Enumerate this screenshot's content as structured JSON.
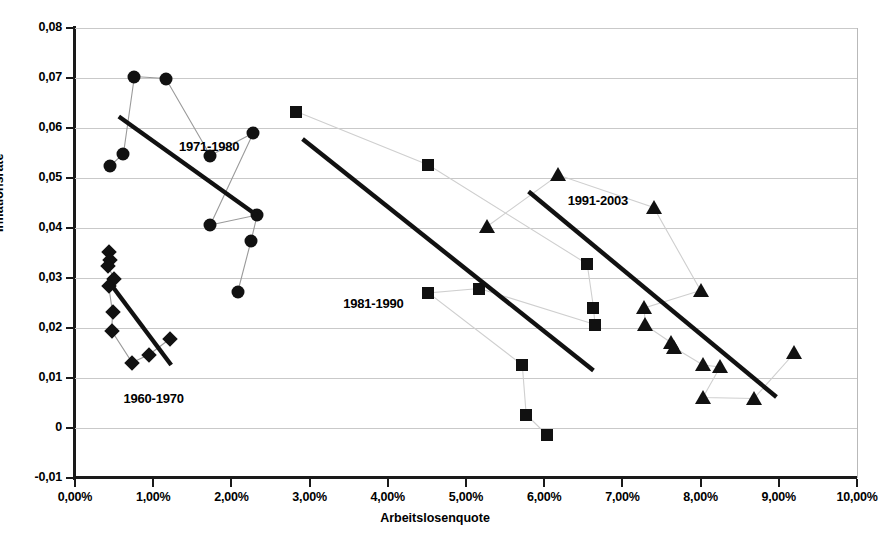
{
  "chart_data": {
    "type": "scatter",
    "title": "",
    "xlabel": "Arbeitslosenquote",
    "ylabel": "Inflationsrate",
    "xlim": [
      0,
      10
    ],
    "ylim": [
      -0.01,
      0.08
    ],
    "x_tick_labels": [
      "0,00%",
      "1,00%",
      "2,00%",
      "3,00%",
      "4,00%",
      "5,00%",
      "6,00%",
      "7,00%",
      "8,00%",
      "9,00%",
      "10,00%"
    ],
    "x_tick_values": [
      0,
      1,
      2,
      3,
      4,
      5,
      6,
      7,
      8,
      9,
      10
    ],
    "y_tick_labels": [
      "0,08",
      "0,07",
      "0,06",
      "0,05",
      "0,04",
      "0,03",
      "0,02",
      "0,01",
      "0",
      "-0,01"
    ],
    "y_tick_values": [
      0.08,
      0.07,
      0.06,
      0.05,
      0.04,
      0.03,
      0.02,
      0.01,
      0,
      -0.01
    ],
    "grid": true,
    "legend": "none",
    "x_unit": "%",
    "series": [
      {
        "name": "1960-1970",
        "marker": "diamond",
        "label": "1960-1970",
        "label_x": 0.62,
        "label_y": 0.0058,
        "connected": true,
        "points": [
          {
            "x": 0.44,
            "y": 0.0352
          },
          {
            "x": 0.45,
            "y": 0.0337
          },
          {
            "x": 0.42,
            "y": 0.0324
          },
          {
            "x": 0.5,
            "y": 0.0299
          },
          {
            "x": 0.43,
            "y": 0.0285
          },
          {
            "x": 0.48,
            "y": 0.0232
          },
          {
            "x": 0.47,
            "y": 0.0194
          },
          {
            "x": 0.73,
            "y": 0.0131
          },
          {
            "x": 0.95,
            "y": 0.0147
          },
          {
            "x": 1.22,
            "y": 0.0179
          }
        ]
      },
      {
        "name": "1971-1980",
        "marker": "circle",
        "label": "1971-1980",
        "label_x": 1.33,
        "label_y": 0.0563,
        "connected": true,
        "points": [
          {
            "x": 0.45,
            "y": 0.0524
          },
          {
            "x": 0.62,
            "y": 0.0549
          },
          {
            "x": 0.76,
            "y": 0.0703
          },
          {
            "x": 1.16,
            "y": 0.0699
          },
          {
            "x": 1.73,
            "y": 0.0545
          },
          {
            "x": 2.28,
            "y": 0.059
          },
          {
            "x": 1.73,
            "y": 0.0406
          },
          {
            "x": 2.33,
            "y": 0.0426
          },
          {
            "x": 2.25,
            "y": 0.0374
          },
          {
            "x": 2.08,
            "y": 0.0272
          }
        ]
      },
      {
        "name": "1981-1990",
        "marker": "square",
        "label": "1981-1990",
        "label_x": 3.43,
        "label_y": 0.0248,
        "connected": true,
        "points": [
          {
            "x": 2.83,
            "y": 0.0633
          },
          {
            "x": 4.52,
            "y": 0.0526
          },
          {
            "x": 6.55,
            "y": 0.0328
          },
          {
            "x": 6.63,
            "y": 0.0241
          },
          {
            "x": 6.65,
            "y": 0.0207
          },
          {
            "x": 5.17,
            "y": 0.0279
          },
          {
            "x": 4.52,
            "y": 0.027
          },
          {
            "x": 5.72,
            "y": 0.0126
          },
          {
            "x": 5.77,
            "y": 0.0027
          },
          {
            "x": 6.03,
            "y": -0.0013
          }
        ]
      },
      {
        "name": "1991-2003",
        "marker": "triangle",
        "label": "1991-2003",
        "label_x": 6.3,
        "label_y": 0.0455,
        "connected": true,
        "points": [
          {
            "x": 5.27,
            "y": 0.0403
          },
          {
            "x": 6.18,
            "y": 0.0506
          },
          {
            "x": 7.4,
            "y": 0.0441
          },
          {
            "x": 8.0,
            "y": 0.0275
          },
          {
            "x": 7.28,
            "y": 0.024
          },
          {
            "x": 7.29,
            "y": 0.0206
          },
          {
            "x": 7.62,
            "y": 0.0171
          },
          {
            "x": 7.66,
            "y": 0.0161
          },
          {
            "x": 8.03,
            "y": 0.0126
          },
          {
            "x": 8.25,
            "y": 0.0122
          },
          {
            "x": 8.03,
            "y": 0.0061
          },
          {
            "x": 8.68,
            "y": 0.0059
          },
          {
            "x": 9.2,
            "y": 0.015
          }
        ]
      }
    ],
    "trendlines": [
      {
        "name": "1960-1970",
        "x1": 0.47,
        "y1": 0.0285,
        "x2": 1.23,
        "y2": 0.0126
      },
      {
        "name": "1971-1980",
        "x1": 0.56,
        "y1": 0.0623,
        "x2": 2.33,
        "y2": 0.0425
      },
      {
        "name": "1981-1990",
        "x1": 2.91,
        "y1": 0.0578,
        "x2": 6.63,
        "y2": 0.0115
      },
      {
        "name": "1991-2003",
        "x1": 5.8,
        "y1": 0.0473,
        "x2": 8.97,
        "y2": 0.0062
      }
    ],
    "colors": {
      "marker": "#111111",
      "trendline": "#111111",
      "connector": "#9a9a9a",
      "gridline": "#c9c9c9",
      "axis": "#1a1a1a"
    }
  },
  "caption": {
    "text": ""
  }
}
